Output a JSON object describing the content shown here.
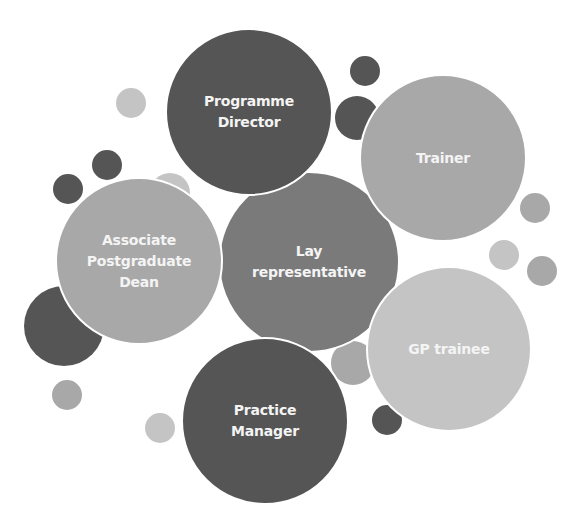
{
  "diagram": {
    "type": "bubble-cluster",
    "title": "",
    "colors": {
      "dark": "#555555",
      "mid": "#7a7a7a",
      "light": "#a8a8a8",
      "pale": "#c4c4c4",
      "paler": "#cfcfcf",
      "text": "#f4f4f4",
      "background": "#ffffff"
    },
    "nodes": [
      {
        "id": "programme-director",
        "label": "Programme\nDirector",
        "cx": 249,
        "cy": 112,
        "r": 84,
        "shade": "dark"
      },
      {
        "id": "trainer",
        "label": "Trainer",
        "cx": 443,
        "cy": 158,
        "r": 84,
        "shade": "light"
      },
      {
        "id": "associate-postgraduate-dean",
        "label": "Associate\nPostgraduate\nDean",
        "cx": 139,
        "cy": 261,
        "r": 84,
        "shade": "light"
      },
      {
        "id": "lay-representative",
        "label": "Lay\nrepresentative",
        "cx": 309,
        "cy": 262,
        "r": 91,
        "shade": "mid"
      },
      {
        "id": "gp-trainee",
        "label": "GP trainee",
        "cx": 449,
        "cy": 349,
        "r": 83,
        "shade": "pale"
      },
      {
        "id": "practice-manager",
        "label": "Practice\nManager",
        "cx": 265,
        "cy": 421,
        "r": 84,
        "shade": "dark"
      }
    ],
    "decorations": [
      {
        "cx": 131,
        "cy": 103,
        "r": 15,
        "shade": "pale"
      },
      {
        "cx": 107,
        "cy": 165,
        "r": 15,
        "shade": "dark"
      },
      {
        "cx": 68,
        "cy": 189,
        "r": 15,
        "shade": "dark"
      },
      {
        "cx": 170,
        "cy": 193,
        "r": 20,
        "shade": "pale"
      },
      {
        "cx": 64,
        "cy": 326,
        "r": 40,
        "shade": "dark"
      },
      {
        "cx": 67,
        "cy": 395,
        "r": 15,
        "shade": "light"
      },
      {
        "cx": 160,
        "cy": 428,
        "r": 15,
        "shade": "pale"
      },
      {
        "cx": 365,
        "cy": 71,
        "r": 15,
        "shade": "dark"
      },
      {
        "cx": 357,
        "cy": 118,
        "r": 22,
        "shade": "dark"
      },
      {
        "cx": 535,
        "cy": 208,
        "r": 15,
        "shade": "light"
      },
      {
        "cx": 504,
        "cy": 255,
        "r": 15,
        "shade": "pale"
      },
      {
        "cx": 542,
        "cy": 271,
        "r": 15,
        "shade": "light"
      },
      {
        "cx": 353,
        "cy": 363,
        "r": 22,
        "shade": "light"
      },
      {
        "cx": 387,
        "cy": 420,
        "r": 15,
        "shade": "dark"
      }
    ]
  }
}
